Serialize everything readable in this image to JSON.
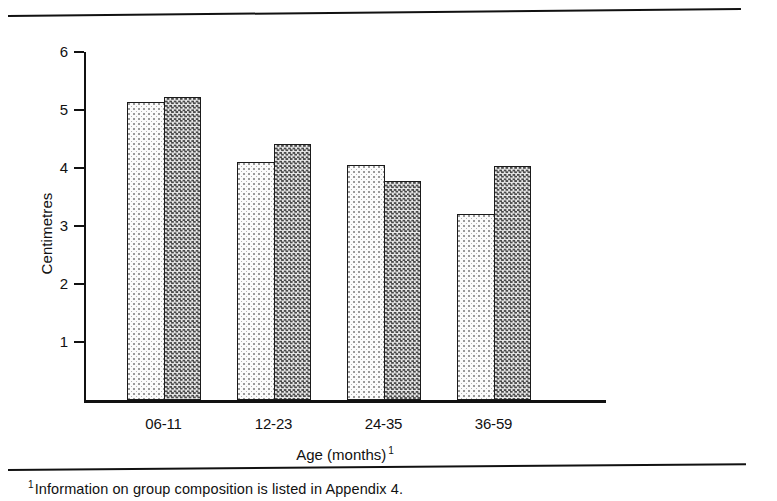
{
  "chart_data": {
    "type": "bar",
    "title": "",
    "subtitle": "",
    "xlabel": "Age (months)",
    "xlabel_superscript": "1",
    "ylabel": "Centimetres",
    "categories": [
      "06-11",
      "12-23",
      "24-35",
      "36-59"
    ],
    "ylim": [
      0,
      6
    ],
    "yticks": [
      1,
      2,
      3,
      4,
      5,
      6
    ],
    "ytick_labels": [
      "1",
      "2",
      "3",
      "4",
      "5",
      "6"
    ],
    "grid": false,
    "legend": "none",
    "series": [
      {
        "name": "light-dotted-series",
        "pattern": "light-dotted",
        "values": [
          5.13,
          4.1,
          4.05,
          3.2
        ]
      },
      {
        "name": "dark-checkered-series",
        "pattern": "dark-checkered",
        "values": [
          5.23,
          4.42,
          3.77,
          4.03
        ]
      }
    ]
  },
  "axis": {
    "y_title": "Centimetres",
    "x_title": "Age (months)",
    "x_title_superscript": "1"
  },
  "footnote": {
    "marker": "1",
    "text": "Information on group composition is listed in Appendix 4."
  },
  "colors": {
    "ink": "#111111",
    "light_fill": "#fbfbfb",
    "dark_fill": "#4a4a4a",
    "background": "#ffffff"
  }
}
